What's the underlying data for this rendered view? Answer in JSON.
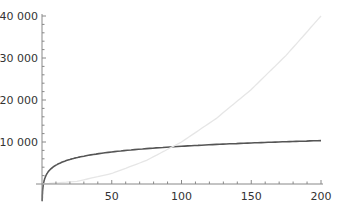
{
  "chart_data": {
    "type": "line",
    "title": "",
    "xlabel": "",
    "ylabel": "",
    "xlim": [
      0,
      200
    ],
    "ylim": [
      -4000,
      40000
    ],
    "grid": false,
    "legend": null,
    "x_ticks": [
      {
        "value": 50,
        "label": "50"
      },
      {
        "value": 100,
        "label": "100"
      },
      {
        "value": 150,
        "label": "150"
      },
      {
        "value": 200,
        "label": "200"
      }
    ],
    "y_ticks": [
      {
        "value": 10000,
        "label": "10 000"
      },
      {
        "value": 20000,
        "label": "20 000"
      },
      {
        "value": 30000,
        "label": "30 000"
      },
      {
        "value": 40000,
        "label": "40 000"
      }
    ],
    "series": [
      {
        "name": "logarithmic curve",
        "color": "#555555",
        "x": [
          0.12,
          0.5,
          1,
          2,
          5,
          10,
          20,
          30,
          50,
          75,
          100,
          125,
          150,
          175,
          200
        ],
        "values": [
          -4100,
          -1350,
          0,
          1350,
          3140,
          4490,
          5840,
          6630,
          7630,
          8420,
          8980,
          9420,
          9770,
          10070,
          10330
        ]
      },
      {
        "name": "quadratic curve",
        "color": "#e6e6e6",
        "x": [
          0,
          25,
          50,
          75,
          100,
          125,
          150,
          175,
          200
        ],
        "values": [
          0,
          625,
          2500,
          5625,
          10000,
          15625,
          22500,
          30625,
          40000
        ]
      }
    ]
  }
}
